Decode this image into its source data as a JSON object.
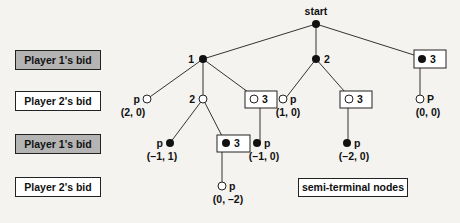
{
  "legend": {
    "rows": [
      {
        "label": "Player 1's bid",
        "style": "gray",
        "color": "#b4b4b4"
      },
      {
        "label": "Player 2's bid",
        "style": "white",
        "color": "#ffffff"
      },
      {
        "label": "Player 1's bid",
        "style": "gray",
        "color": "#b4b4b4"
      },
      {
        "label": "Player 2's bid",
        "style": "white",
        "color": "#ffffff"
      }
    ]
  },
  "tree": {
    "root": {
      "label": "start",
      "fill": "filled"
    },
    "level1": [
      {
        "label": "1",
        "fill": "filled"
      },
      {
        "label": "2",
        "fill": "filled"
      },
      {
        "label": "3",
        "fill": "filled",
        "boxed": true
      }
    ],
    "level2": [
      {
        "label": "p",
        "fill": "open",
        "payoff": "(2, 0)"
      },
      {
        "label": "2",
        "fill": "open"
      },
      {
        "label": "3",
        "fill": "open",
        "boxed": true
      },
      {
        "label": "p",
        "fill": "open",
        "payoff": "(1, 0)"
      },
      {
        "label": "3",
        "fill": "open",
        "boxed": true
      },
      {
        "label": "P",
        "fill": "open",
        "payoff": "(0, 0)"
      }
    ],
    "level3": [
      {
        "label": "p",
        "fill": "filled",
        "payoff": "(–1, 1)"
      },
      {
        "label": "3",
        "fill": "filled",
        "boxed": true
      },
      {
        "label": "p",
        "fill": "filled",
        "payoff": "(–1, 0)"
      },
      {
        "label": "p",
        "fill": "filled",
        "payoff": "(–2, 0)"
      }
    ],
    "level4": [
      {
        "label": "p",
        "fill": "open",
        "payoff": "(0, –2)"
      }
    ]
  },
  "annotation": {
    "semi_terminal": "semi-terminal nodes"
  },
  "colors": {
    "line": "#333333",
    "node_fill": "#111111",
    "gray_box": "#b4b4b4",
    "background": "#f4f3f0"
  }
}
